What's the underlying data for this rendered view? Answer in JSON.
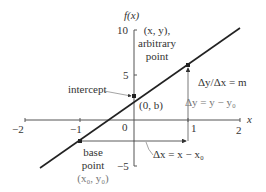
{
  "diagram": {
    "type": "linear-function-graph",
    "axes": {
      "x_label": "x",
      "y_label": "f(x)",
      "x_ticks": [
        "−2",
        "−1",
        "0",
        "1",
        "2"
      ],
      "y_ticks": [
        "10",
        "5",
        "−5"
      ]
    },
    "annotations": {
      "arbitrary_point_line1": "(x, y),",
      "arbitrary_point_line2": "arbitrary",
      "arbitrary_point_line3": "point",
      "slope": "Δy/Δx = m",
      "delta_y": "Δy = y − y₀",
      "intercept_label": "intercept",
      "intercept_point": "(0, b)",
      "base_point_line1": "base",
      "base_point_line2": "point",
      "base_point_line3": "(x₀, y₀)",
      "delta_x": "Δx = x − x₀"
    },
    "points": {
      "base": {
        "x": -1,
        "y": -2.3
      },
      "intercept": {
        "x": 0,
        "y": 2.7
      },
      "arbitrary": {
        "x": 1,
        "y": 6.1
      }
    },
    "colors": {
      "line": "#222222",
      "axes": "#555555",
      "text": "#333333",
      "muted_text": "#777777"
    }
  }
}
